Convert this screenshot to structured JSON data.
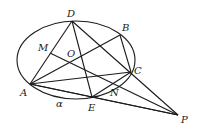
{
  "figure": {
    "type": "geometry-diagram",
    "labels": {
      "A": "A",
      "B": "B",
      "C": "C",
      "D": "D",
      "E": "E",
      "M": "M",
      "N": "N",
      "O": "O",
      "P": "P",
      "alpha": "α"
    },
    "segments": [
      [
        "A",
        "D"
      ],
      [
        "A",
        "B"
      ],
      [
        "A",
        "C"
      ],
      [
        "A",
        "E"
      ],
      [
        "A",
        "P"
      ],
      [
        "D",
        "E"
      ],
      [
        "D",
        "P"
      ],
      [
        "B",
        "C"
      ],
      [
        "C",
        "E"
      ],
      [
        "M",
        "P"
      ],
      [
        "E",
        "P"
      ],
      [
        "C",
        "P"
      ]
    ],
    "stroke_color": "#1a1a1a"
  }
}
